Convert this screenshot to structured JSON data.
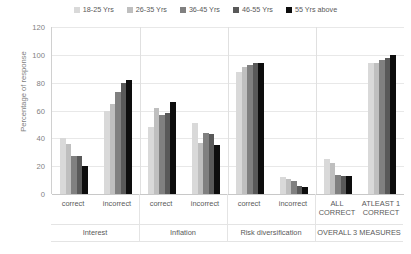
{
  "chart_data": {
    "type": "bar",
    "title": "",
    "xlabel": "",
    "ylabel": "Percentage of response",
    "ylim": [
      0,
      120
    ],
    "yticks": [
      0,
      20,
      40,
      60,
      80,
      100,
      120
    ],
    "grid": true,
    "legend_position": "top-center",
    "categories": [
      "correct",
      "incorrect",
      "correct",
      "incorrect",
      "correct",
      "incorrect",
      "ALL CORRECT",
      "ATLEAST 1 CORRECT"
    ],
    "groups": [
      {
        "label": "Interest",
        "span": 2
      },
      {
        "label": "Inflation",
        "span": 2
      },
      {
        "label": "Risk diversification",
        "span": 2
      },
      {
        "label": "OVERALL 3 MEASURES",
        "span": 2
      }
    ],
    "series": [
      {
        "name": "18-25 Yrs",
        "color": "#d9d9d9",
        "values": [
          40,
          60,
          48,
          51,
          88,
          12,
          25,
          94
        ]
      },
      {
        "name": "26-35 Yrs",
        "color": "#bfbfbf",
        "values": [
          36,
          65,
          62,
          37,
          91,
          11,
          22,
          94
        ]
      },
      {
        "name": "36-45 Yrs",
        "color": "#808080",
        "values": [
          27,
          73,
          57,
          44,
          93,
          9,
          14,
          96
        ]
      },
      {
        "name": "46-55 Yrs",
        "color": "#595959",
        "values": [
          27,
          80,
          58,
          43,
          94,
          6,
          13,
          98
        ]
      },
      {
        "name": "55 Yrs above",
        "color": "#0d0d0d",
        "values": [
          20,
          82,
          66,
          35,
          94,
          5,
          13,
          100
        ]
      }
    ]
  }
}
